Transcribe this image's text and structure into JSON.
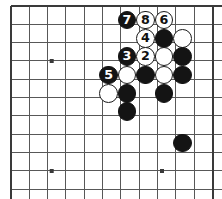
{
  "diagram": {
    "kind": "go-board-diagram",
    "board": {
      "width_px": 222,
      "height_px": 199,
      "grid_spacing_px": 18.33,
      "origin_x_px": 11,
      "origin_y_px": 6,
      "cols": 12,
      "rows": 11,
      "edges_drawn": [
        "top",
        "left",
        "right"
      ],
      "line_color": "#585858",
      "edge_color": "#3a3a3a",
      "background_color": "#ffffff",
      "stone_radius_px": 9.4
    },
    "star_points": [
      {
        "x_px": 51.7,
        "y_px": 61.0
      },
      {
        "x_px": 51.7,
        "y_px": 171.0
      },
      {
        "x_px": 162.0,
        "y_px": 171.0
      }
    ],
    "colors": {
      "black_stone": "#141414",
      "white_stone": "#ffffff",
      "stone_outline": "#1a1a1a",
      "black_label": "#ffffff",
      "white_label": "#111111"
    },
    "stones": [
      {
        "id": "s-b7",
        "color": "black",
        "label": "7",
        "x_px": 127.0,
        "y_px": 20.0
      },
      {
        "id": "s-w8",
        "color": "white",
        "label": "8",
        "x_px": 145.5,
        "y_px": 20.0
      },
      {
        "id": "s-w6",
        "color": "white",
        "label": "6",
        "x_px": 164.0,
        "y_px": 20.0
      },
      {
        "id": "s-w4",
        "color": "white",
        "label": "4",
        "x_px": 145.5,
        "y_px": 38.3
      },
      {
        "id": "s-b-a",
        "color": "black",
        "label": "",
        "x_px": 164.0,
        "y_px": 38.3
      },
      {
        "id": "s-w-a",
        "color": "white",
        "label": "",
        "x_px": 182.3,
        "y_px": 38.3
      },
      {
        "id": "s-b3",
        "color": "black",
        "label": "3",
        "x_px": 127.0,
        "y_px": 56.6
      },
      {
        "id": "s-w2",
        "color": "white",
        "label": "2",
        "x_px": 145.5,
        "y_px": 56.6
      },
      {
        "id": "s-w-b",
        "color": "white",
        "label": "",
        "x_px": 164.0,
        "y_px": 56.6
      },
      {
        "id": "s-b-b",
        "color": "black",
        "label": "",
        "x_px": 182.3,
        "y_px": 56.6
      },
      {
        "id": "s-b5",
        "color": "black",
        "label": "5",
        "x_px": 108.7,
        "y_px": 74.9
      },
      {
        "id": "s-w-c",
        "color": "white",
        "label": "",
        "x_px": 127.0,
        "y_px": 74.9
      },
      {
        "id": "s-b-c",
        "color": "black",
        "label": "",
        "x_px": 145.5,
        "y_px": 74.9
      },
      {
        "id": "s-w-d",
        "color": "white",
        "label": "",
        "x_px": 164.0,
        "y_px": 74.9
      },
      {
        "id": "s-b-d",
        "color": "black",
        "label": "",
        "x_px": 182.3,
        "y_px": 74.9
      },
      {
        "id": "s-w-e",
        "color": "white",
        "label": "",
        "x_px": 108.7,
        "y_px": 93.2
      },
      {
        "id": "s-b-e",
        "color": "black",
        "label": "",
        "x_px": 127.0,
        "y_px": 93.2
      },
      {
        "id": "s-b-f",
        "color": "black",
        "label": "",
        "x_px": 164.0,
        "y_px": 93.2
      },
      {
        "id": "s-b-g",
        "color": "black",
        "label": "",
        "x_px": 127.0,
        "y_px": 111.5
      },
      {
        "id": "s-b-h",
        "color": "black",
        "label": "",
        "x_px": 182.3,
        "y_px": 143.0
      }
    ]
  }
}
